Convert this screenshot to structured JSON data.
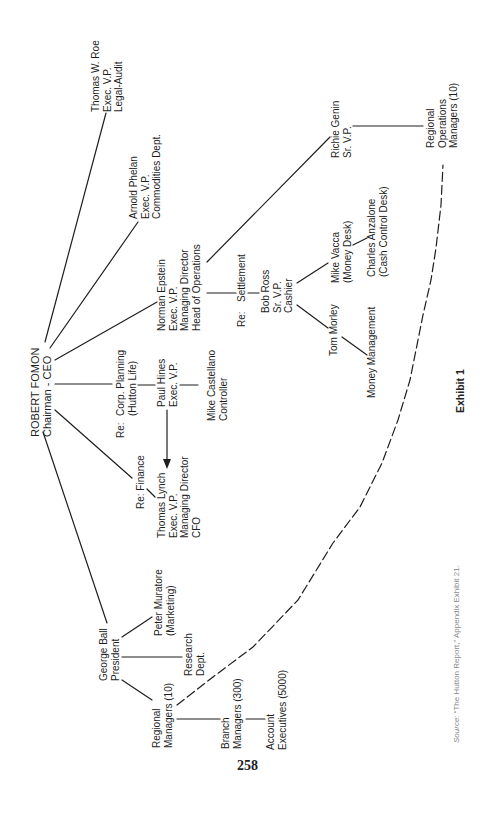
{
  "page": {
    "number": "258",
    "exhibit_label": "Exhibit 1",
    "source": {
      "prefix": "Source:",
      "text": " “The Hutton Report,” Appendix Exhibit 21."
    }
  },
  "nodes": {
    "ceo": {
      "lines": [
        "ROBERT FOMON",
        "Chairman - CEO"
      ]
    },
    "roe": {
      "lines": [
        "Thomas W. Roe",
        "Exec. V.P.",
        "Legal-Audit"
      ]
    },
    "phelan": {
      "lines": [
        "Arnold Phelan",
        "Exec. V.P.",
        "Commodities Dept."
      ]
    },
    "epstein": {
      "lines": [
        "Norman Epstein",
        "Exec. V.P.",
        "Managing Director",
        "Head of Operations"
      ]
    },
    "corp_planning": {
      "prefix": "Re:",
      "lines": [
        "Corp. Planning",
        "(Hutton Life)"
      ]
    },
    "hines": {
      "lines": [
        "Paul Hines",
        "Exec. V.P."
      ]
    },
    "castellano": {
      "lines": [
        "Mike Castellano",
        "Controller"
      ]
    },
    "finance": {
      "lines": [
        "Re: Finance"
      ]
    },
    "lynch": {
      "lines": [
        "Thomas Lynch",
        "Exec. V.P.",
        "Managing Director",
        "CFO"
      ]
    },
    "genin": {
      "lines": [
        "Richie Genin",
        "Sr. V.P."
      ]
    },
    "regional_ops": {
      "lines": [
        "Regional",
        "Operations",
        "Managers (10)"
      ]
    },
    "settlement": {
      "prefix": "Re:",
      "lines": [
        "Settlement"
      ]
    },
    "ross": {
      "lines": [
        "Bob Ross",
        "Sr. V.P.",
        "Cashier"
      ]
    },
    "vacca": {
      "lines": [
        "Mike Vacca",
        "(Money Desk)"
      ]
    },
    "anzalone": {
      "lines": [
        "Charles Anzalone",
        "(Cash Control Desk)"
      ]
    },
    "morley": {
      "lines": [
        "Tom Morley"
      ]
    },
    "money_mgmt": {
      "lines": [
        "Money Management"
      ]
    },
    "ball": {
      "lines": [
        "George Ball",
        "President"
      ]
    },
    "muratore": {
      "lines": [
        "Peter Muratore",
        "(Marketing)"
      ]
    },
    "research": {
      "lines": [
        "Research",
        "Dept."
      ]
    },
    "regional_mgrs": {
      "lines": [
        "Regional",
        "Managers (10)"
      ]
    },
    "branch_mgrs": {
      "lines": [
        "Branch",
        "Managers (300)"
      ]
    },
    "account_execs": {
      "lines": [
        "Account",
        "Executives (5000)"
      ]
    }
  },
  "edges": [
    {
      "from": "ceo",
      "to": "roe",
      "style": "solid"
    },
    {
      "from": "ceo",
      "to": "phelan",
      "style": "solid"
    },
    {
      "from": "ceo",
      "to": "epstein",
      "style": "solid"
    },
    {
      "from": "ceo",
      "to": "corp_planning",
      "style": "solid"
    },
    {
      "from": "ceo",
      "to": "finance",
      "style": "solid"
    },
    {
      "from": "ceo",
      "to": "ball",
      "style": "solid"
    },
    {
      "from": "corp_planning",
      "to": "hines",
      "style": "solid"
    },
    {
      "from": "hines",
      "to": "castellano",
      "style": "solid"
    },
    {
      "from": "hines",
      "to": "lynch",
      "style": "arrow"
    },
    {
      "from": "finance",
      "to": "lynch",
      "style": "solid"
    },
    {
      "from": "epstein",
      "to": "genin",
      "style": "solid"
    },
    {
      "from": "epstein",
      "to": "settlement",
      "style": "solid"
    },
    {
      "from": "settlement",
      "to": "ross",
      "style": "solid"
    },
    {
      "from": "ross",
      "to": "vacca",
      "style": "solid"
    },
    {
      "from": "ross",
      "to": "morley",
      "style": "solid"
    },
    {
      "from": "vacca",
      "to": "anzalone",
      "style": "solid"
    },
    {
      "from": "morley",
      "to": "money_mgmt",
      "style": "solid"
    },
    {
      "from": "genin",
      "to": "regional_ops",
      "style": "solid"
    },
    {
      "from": "ball",
      "to": "muratore",
      "style": "solid"
    },
    {
      "from": "ball",
      "to": "research",
      "style": "solid"
    },
    {
      "from": "ball",
      "to": "regional_mgrs",
      "style": "solid"
    },
    {
      "from": "regional_mgrs",
      "to": "branch_mgrs",
      "style": "solid"
    },
    {
      "from": "branch_mgrs",
      "to": "account_execs",
      "style": "solid"
    },
    {
      "from": "regional_mgrs",
      "to": "regional_ops",
      "style": "dashed"
    }
  ],
  "colors": {
    "ink": "#1e1e1e",
    "source_text": "#8a8a8a",
    "background": "#ffffff"
  }
}
